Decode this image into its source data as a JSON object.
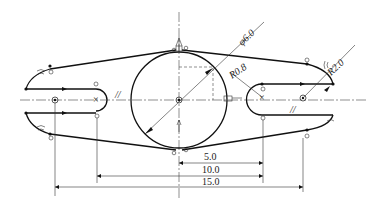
{
  "drawing": {
    "type": "2D sketch with geometric constraints",
    "dimensions": {
      "diameter": "φ6.0",
      "radius_small": "R0.8",
      "radius_large": "R2.0",
      "horizontal_1": "5.0",
      "horizontal_2": "10.0",
      "horizontal_3": "15.0"
    },
    "symbols": {
      "parallel": "//",
      "tangent_marks": "tangent-constraint",
      "equal_marks": "equal-constraint",
      "coincident_marks": "coincident-constraint"
    },
    "colors": {
      "line": "#111111",
      "background": "#ffffff"
    }
  }
}
